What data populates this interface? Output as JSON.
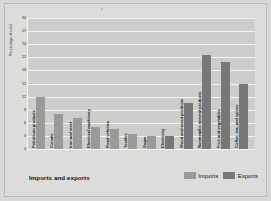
{
  "figure": {
    "y_axis_title": "Percentage of total",
    "x_axis_title": "Imports and exports"
  },
  "legend": {
    "items": [
      {
        "label": "Imports",
        "color": "#9a9a98",
        "key": "imports"
      },
      {
        "label": "Exports",
        "color": "#77777a",
        "key": "exports"
      }
    ]
  },
  "chart_data": {
    "type": "bar",
    "title": "",
    "subtitle": "",
    "xlabel": "Imports and exports",
    "ylabel": "Percentage of total",
    "ylim": [
      0,
      30
    ],
    "ytick_labels": [
      "30",
      "27",
      "24",
      "21",
      "18",
      "15",
      "12",
      "9",
      "6",
      "3",
      "0"
    ],
    "yticks": [
      30,
      27,
      24,
      21,
      18,
      15,
      12,
      9,
      6,
      3,
      0
    ],
    "grid": true,
    "legend_position": "bottom-right",
    "categories": [
      "Petroleum products",
      "Cereals",
      "Iron and steel",
      "Electrical machinery",
      "Road vehicles",
      "Textiles",
      "Sugar",
      "Electricity",
      "Wood and wood products",
      "Nonmetallic mineral products",
      "Fruit and vegetables",
      "Coffee, tea, and spices"
    ],
    "bars": [
      {
        "category": "Petroleum products",
        "value": 12.0,
        "series": "Imports"
      },
      {
        "category": "Cereals",
        "value": 8.0,
        "series": "Imports"
      },
      {
        "category": "Iron and steel",
        "value": 7.0,
        "series": "Imports"
      },
      {
        "category": "Electrical machinery",
        "value": 5.0,
        "series": "Imports"
      },
      {
        "category": "Road vehicles",
        "value": 4.5,
        "series": "Imports"
      },
      {
        "category": "Textiles",
        "value": 3.5,
        "series": "Imports"
      },
      {
        "category": "Sugar",
        "value": 3.0,
        "series": "Imports"
      },
      {
        "category": "Electricity",
        "value": 3.0,
        "series": "Exports"
      },
      {
        "category": "Wood and wood products",
        "value": 10.5,
        "series": "Exports"
      },
      {
        "category": "Nonmetallic mineral products",
        "value": 21.5,
        "series": "Exports"
      },
      {
        "category": "Fruit and vegetables",
        "value": 20.0,
        "series": "Exports"
      },
      {
        "category": "Coffee, tea, and spices",
        "value": 15.0,
        "series": "Exports"
      }
    ]
  }
}
